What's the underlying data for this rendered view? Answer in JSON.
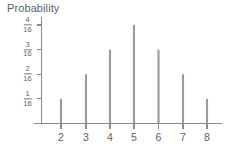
{
  "chart_data": {
    "type": "bar",
    "title": "Probability",
    "xlabel": "",
    "ylabel": "Probability",
    "categories": [
      "2",
      "3",
      "4",
      "5",
      "6",
      "7",
      "8"
    ],
    "values": [
      0.0625,
      0.125,
      0.1875,
      0.25,
      0.1875,
      0.125,
      0.0625
    ],
    "value_labels": [
      "1/16",
      "2/16",
      "3/16",
      "4/16",
      "3/16",
      "2/16",
      "1/16"
    ],
    "ylim": [
      0,
      0.25
    ],
    "xlim": [
      1.4,
      8.6
    ],
    "grid": false,
    "legend": false,
    "legend_position": "none",
    "y_ticks": [
      {
        "value": 0.0625,
        "numerator": "1",
        "denominator": "16"
      },
      {
        "value": 0.125,
        "numerator": "2",
        "denominator": "16"
      },
      {
        "value": 0.1875,
        "numerator": "3",
        "denominator": "16"
      },
      {
        "value": 0.25,
        "numerator": "4",
        "denominator": "16"
      }
    ],
    "x_ticks": [
      "2",
      "3",
      "4",
      "5",
      "6",
      "7",
      "8"
    ],
    "style": "stem",
    "colors": {
      "stem": "#9a9a9c",
      "axis": "#8a8a8c",
      "text": "#5e5e60",
      "background": "#ffffff"
    }
  }
}
